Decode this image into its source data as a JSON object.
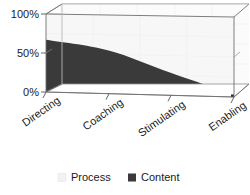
{
  "chart_data": {
    "type": "area",
    "title": "",
    "subtitle": "",
    "xlabel": "",
    "ylabel": "",
    "categories": [
      "Directing",
      "Coaching",
      "Stimulating",
      "Enabling"
    ],
    "series": [
      {
        "name": "Content",
        "values": [
          67,
          55,
          28,
          3
        ],
        "color": "#3a3a3a"
      },
      {
        "name": "Process",
        "values": [
          33,
          45,
          72,
          97
        ],
        "color": "#f2f2f2"
      }
    ],
    "stacked": true,
    "ylim": [
      0,
      100
    ],
    "ytick_labels": [
      "0%",
      "50%",
      "100%"
    ],
    "ytick_values": [
      0,
      50,
      100
    ],
    "grid": true,
    "legend_position": "bottom",
    "three_d": true
  },
  "axis": {
    "y_ticks": [
      {
        "label": "100%",
        "value": 100
      },
      {
        "label": "50%",
        "value": 50
      },
      {
        "label": "0%",
        "value": 0
      }
    ],
    "x_categories": [
      {
        "label": "Directing"
      },
      {
        "label": "Coaching"
      },
      {
        "label": "Stimulating"
      },
      {
        "label": "Enabling"
      }
    ]
  },
  "legend": {
    "items": [
      {
        "label": "Process",
        "color": "#f2f2f2"
      },
      {
        "label": "Content",
        "color": "#3a3a3a"
      }
    ]
  },
  "colors": {
    "process": "#f2f2f2",
    "content": "#3a3a3a",
    "plot_back": "#fbfbfb",
    "grid": "#e6e6e6",
    "axis": "#555555",
    "floor": "#ffffff",
    "edge": "#8a8a8a",
    "text": "#1a1a1a"
  }
}
